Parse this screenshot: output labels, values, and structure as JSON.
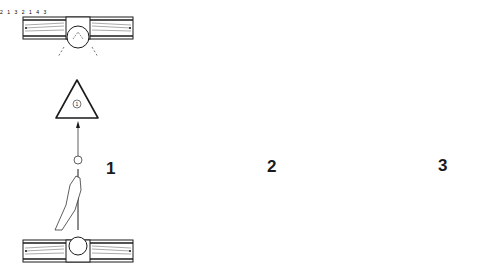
{
  "panels": [
    {
      "step": "1",
      "rack_ball": "1",
      "top_pocket_ball": "",
      "bottom_pocket_ball": "",
      "description": "Rack at centre, cue aimed at apex ball 1"
    },
    {
      "step": "2",
      "rack_ball": "1",
      "top_pocket_ball": "2",
      "bottom_pocket_ball": "3",
      "description": "Rack moved to top rail, ball 2 at pocket"
    },
    {
      "step": "3",
      "rack_balls": [
        "1",
        "4"
      ],
      "top_pocket_ball": "2",
      "bottom_pocket_ball": "3",
      "description": "Inverted triangle at bottom with ball 3"
    }
  ],
  "colors": {
    "ink": "#1a1a1a",
    "background": "#ffffff"
  }
}
